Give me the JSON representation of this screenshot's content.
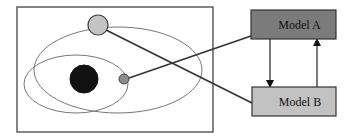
{
  "diagram": {
    "type": "orbital-model-diagram",
    "scene": {
      "frame": {
        "x": 17,
        "y": 7,
        "width": 196,
        "height": 125
      },
      "orbits": [
        {
          "id": "outer-orbit",
          "cx": 118,
          "cy": 70,
          "rx": 84,
          "ry": 43
        },
        {
          "id": "inner-orbit",
          "cx": 76,
          "cy": 84,
          "rx": 52,
          "ry": 29
        }
      ],
      "sun": {
        "cx": 84,
        "cy": 79,
        "r": 14,
        "color": "#111111"
      },
      "planets": [
        {
          "id": "large-planet",
          "cx": 98,
          "cy": 25,
          "r": 10,
          "color": "#c4c4c4"
        },
        {
          "id": "small-planet",
          "cx": 124,
          "cy": 79,
          "r": 5,
          "color": "#8c8c8c"
        }
      ]
    },
    "models": [
      {
        "id": "model-a",
        "label": "Model A",
        "x": 251,
        "y": 10,
        "width": 85,
        "height": 29,
        "color": "#7b7b7b"
      },
      {
        "id": "model-b",
        "label": "Model B",
        "x": 252,
        "y": 87,
        "width": 84,
        "height": 29,
        "color": "#c2c2c2"
      }
    ],
    "connections": [
      {
        "from": "small-planet",
        "to": "model-a",
        "x1": 129,
        "y1": 78,
        "x2": 251,
        "y2": 36
      },
      {
        "from": "large-planet",
        "to": "model-b",
        "x1": 106,
        "y1": 30,
        "x2": 252,
        "y2": 103
      }
    ],
    "arrows": [
      {
        "from": "model-a",
        "to": "model-b",
        "x": 270,
        "y1": 39,
        "y2": 87,
        "direction": "down"
      },
      {
        "from": "model-b",
        "to": "model-a",
        "x": 317,
        "y1": 87,
        "y2": 39,
        "direction": "up"
      }
    ],
    "colors": {
      "stroke": "#333333",
      "orbit": "#777777",
      "frame": "#444444"
    }
  }
}
